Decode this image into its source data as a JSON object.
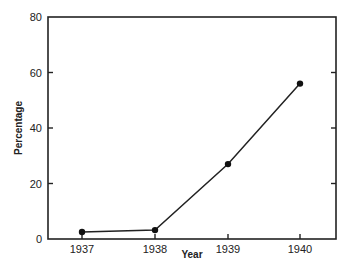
{
  "chart_data": {
    "type": "line",
    "title": "",
    "xlabel": "Year",
    "ylabel": "Percentage",
    "categories": [
      "1937",
      "1938",
      "1939",
      "1940"
    ],
    "series": [
      {
        "name": "Percentage",
        "values": [
          2.5,
          3.2,
          27,
          56
        ],
        "markers": true
      }
    ],
    "ylim": [
      0,
      80
    ],
    "yticks": [
      0,
      20,
      40,
      60,
      80
    ],
    "ytick_labels": [
      "0",
      "20",
      "40",
      "60",
      "80"
    ],
    "grid": false,
    "legend": "none",
    "frame": "box",
    "right_axis_ticks": true
  }
}
